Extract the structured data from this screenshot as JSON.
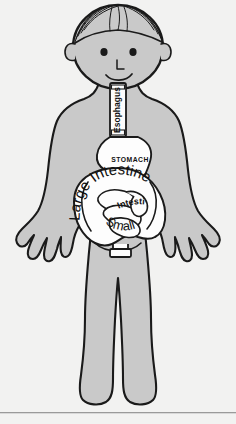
{
  "diagram": {
    "background_color": "#f2f2f1",
    "body_fill": "#c9c9c9",
    "organ_fill": "#fdfdfd",
    "outline_color": "#1a1a1a",
    "divider_color": "#9a9a9a"
  },
  "figure": {
    "name": "cartoon-child",
    "parts": [
      {
        "name": "head",
        "label": ""
      },
      {
        "name": "hair",
        "label": ""
      },
      {
        "name": "left-ear",
        "label": ""
      },
      {
        "name": "right-ear",
        "label": ""
      },
      {
        "name": "left-eye",
        "label": ""
      },
      {
        "name": "right-eye",
        "label": ""
      },
      {
        "name": "nose",
        "label": ""
      },
      {
        "name": "mouth",
        "label": ""
      },
      {
        "name": "neck",
        "label": ""
      },
      {
        "name": "torso",
        "label": ""
      },
      {
        "name": "left-arm",
        "label": ""
      },
      {
        "name": "right-arm",
        "label": ""
      },
      {
        "name": "left-hand",
        "label": ""
      },
      {
        "name": "right-hand",
        "label": ""
      },
      {
        "name": "left-leg",
        "label": ""
      },
      {
        "name": "right-leg",
        "label": ""
      },
      {
        "name": "left-foot",
        "label": ""
      },
      {
        "name": "right-foot",
        "label": ""
      }
    ]
  },
  "organs": {
    "esophagus": {
      "label": "Esophagus",
      "orientation": "vertical-rotated",
      "shape": "tube"
    },
    "stomach": {
      "label": "STOMACH",
      "orientation": "horizontal",
      "shape": "curved-pouch"
    },
    "large_intestine": {
      "label": "Large Intestine",
      "orientation": "curved-arc",
      "shape": "outer-loop"
    },
    "small_intestine": {
      "label_line1": "Intestine",
      "label_line2": "Small",
      "orientation": "curved-arc",
      "shape": "coiled-loops"
    },
    "rectum": {
      "label": "",
      "shape": "small-rectangle"
    }
  }
}
